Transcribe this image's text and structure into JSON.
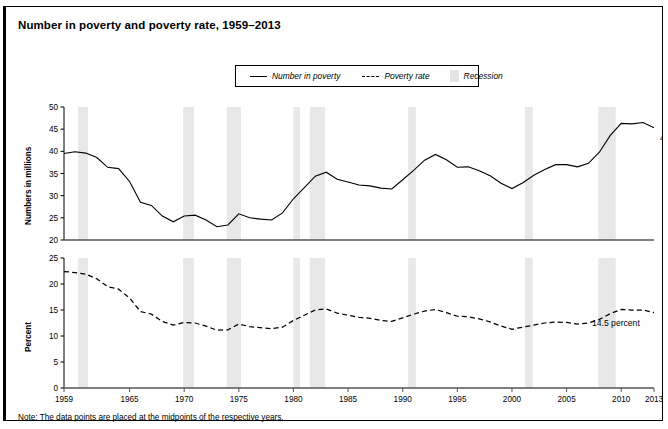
{
  "title": "Number in poverty and poverty rate, 1959–2013",
  "note": "Note: The data points are placed at the midpoints of the respective years.",
  "legend": {
    "series_number": "Number in poverty",
    "series_rate": "Poverty rate",
    "recession": "Recession"
  },
  "axis_titles": {
    "top": "Numbers in millions",
    "bottom": "Percent"
  },
  "annotations": {
    "number_last": "45.3 million",
    "rate_last": "14.5 percent"
  },
  "colors": {
    "line": "#000000",
    "recession_band": "#e8e8e8",
    "frame": "#000000",
    "background": "#ffffff"
  },
  "chart_data": {
    "type": "line",
    "title": "Number in poverty and poverty rate, 1959–2013",
    "xlabel": "",
    "xlim": [
      1959,
      2013
    ],
    "xticks": [
      1959,
      1965,
      1970,
      1975,
      1980,
      1985,
      1990,
      1995,
      2000,
      2005,
      2010,
      2013
    ],
    "grid": false,
    "legend_position": "top-center",
    "recessions": [
      [
        1960.3,
        1961.2
      ],
      [
        1969.9,
        1970.9
      ],
      [
        1973.9,
        1975.2
      ],
      [
        1980.0,
        1980.6
      ],
      [
        1981.5,
        1982.9
      ],
      [
        1990.5,
        1991.2
      ],
      [
        2001.2,
        2001.9
      ],
      [
        2007.9,
        2009.5
      ]
    ],
    "panels": [
      {
        "name": "Number in poverty",
        "ylabel": "Numbers in millions",
        "ylim": [
          20,
          50
        ],
        "yticks": [
          20,
          25,
          30,
          35,
          40,
          45,
          50
        ],
        "linestyle": "solid",
        "x": [
          1959,
          1960,
          1961,
          1962,
          1963,
          1964,
          1965,
          1966,
          1967,
          1968,
          1969,
          1970,
          1971,
          1972,
          1973,
          1974,
          1975,
          1976,
          1977,
          1978,
          1979,
          1980,
          1981,
          1982,
          1983,
          1984,
          1985,
          1986,
          1987,
          1988,
          1989,
          1990,
          1991,
          1992,
          1993,
          1994,
          1995,
          1996,
          1997,
          1998,
          1999,
          2000,
          2001,
          2002,
          2003,
          2004,
          2005,
          2006,
          2007,
          2008,
          2009,
          2010,
          2011,
          2012,
          2013
        ],
        "y": [
          39.5,
          39.9,
          39.6,
          38.6,
          36.4,
          36.1,
          33.2,
          28.5,
          27.8,
          25.4,
          24.1,
          25.4,
          25.6,
          24.5,
          23.0,
          23.4,
          25.9,
          25.0,
          24.7,
          24.5,
          26.1,
          29.3,
          31.8,
          34.4,
          35.3,
          33.7,
          33.1,
          32.4,
          32.2,
          31.7,
          31.5,
          33.6,
          35.7,
          38.0,
          39.3,
          38.1,
          36.4,
          36.5,
          35.6,
          34.5,
          32.8,
          31.6,
          32.9,
          34.6,
          35.9,
          37.0,
          37.0,
          36.5,
          37.3,
          39.8,
          43.6,
          46.3,
          46.2,
          46.5,
          45.3
        ],
        "annotation": {
          "text": "45.3 million",
          "x": 2013,
          "y": 45.3
        }
      },
      {
        "name": "Poverty rate",
        "ylabel": "Percent",
        "ylim": [
          0,
          25
        ],
        "yticks": [
          0,
          5,
          10,
          15,
          20,
          25
        ],
        "linestyle": "dashed",
        "x": [
          1959,
          1960,
          1961,
          1962,
          1963,
          1964,
          1965,
          1966,
          1967,
          1968,
          1969,
          1970,
          1971,
          1972,
          1973,
          1974,
          1975,
          1976,
          1977,
          1978,
          1979,
          1980,
          1981,
          1982,
          1983,
          1984,
          1985,
          1986,
          1987,
          1988,
          1989,
          1990,
          1991,
          1992,
          1993,
          1994,
          1995,
          1996,
          1997,
          1998,
          1999,
          2000,
          2001,
          2002,
          2003,
          2004,
          2005,
          2006,
          2007,
          2008,
          2009,
          2010,
          2011,
          2012,
          2013
        ],
        "y": [
          22.4,
          22.2,
          21.9,
          21.0,
          19.5,
          19.0,
          17.3,
          14.7,
          14.2,
          12.8,
          12.1,
          12.6,
          12.5,
          11.9,
          11.1,
          11.2,
          12.3,
          11.8,
          11.6,
          11.4,
          11.7,
          13.0,
          14.0,
          15.0,
          15.2,
          14.4,
          14.0,
          13.6,
          13.4,
          13.0,
          12.8,
          13.5,
          14.2,
          14.8,
          15.1,
          14.5,
          13.8,
          13.7,
          13.3,
          12.7,
          11.9,
          11.3,
          11.7,
          12.1,
          12.5,
          12.7,
          12.6,
          12.3,
          12.5,
          13.2,
          14.3,
          15.1,
          15.0,
          15.0,
          14.5
        ],
        "annotation": {
          "text": "14.5 percent",
          "x": 2013,
          "y": 14.5
        }
      }
    ]
  }
}
